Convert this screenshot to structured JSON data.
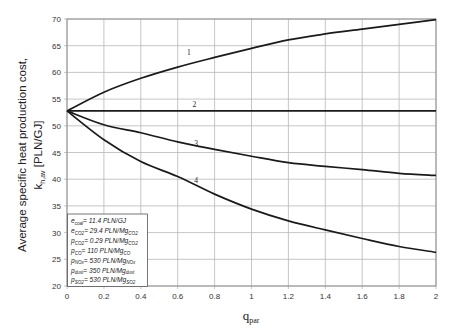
{
  "chart_data": {
    "type": "line",
    "title": "",
    "xlabel": "q_par",
    "xlabel_main": "q",
    "xlabel_sub": "par",
    "ylabel_line1": "Average specific heat production cost,",
    "ylabel_line2_main": "k",
    "ylabel_line2_sub": "h,av",
    "ylabel_line2_unit": " [PLN/GJ]",
    "xlim": [
      0,
      2
    ],
    "ylim": [
      20,
      70
    ],
    "grid": true,
    "x_ticks": [
      "0",
      "0.2",
      "0.4",
      "0.6",
      "0.8",
      "1",
      "1.2",
      "1.4",
      "1.6",
      "1.8",
      "2"
    ],
    "y_ticks": [
      "20",
      "25",
      "30",
      "35",
      "40",
      "45",
      "50",
      "55",
      "60",
      "65",
      "70"
    ],
    "x": [
      0,
      0.2,
      0.4,
      0.6,
      0.8,
      1.0,
      1.2,
      1.4,
      1.6,
      1.8,
      2.0
    ],
    "series": [
      {
        "name": "1",
        "values": [
          52.8,
          56.3,
          58.9,
          61.0,
          62.8,
          64.5,
          66.1,
          67.2,
          68.1,
          69.0,
          69.9
        ],
        "label_pos": [
          0.66,
          63.2
        ]
      },
      {
        "name": "2",
        "values": [
          52.8,
          52.8,
          52.8,
          52.8,
          52.8,
          52.8,
          52.8,
          52.8,
          52.8,
          52.8,
          52.8
        ],
        "label_pos": [
          0.69,
          53.6
        ]
      },
      {
        "name": "3",
        "values": [
          52.8,
          50.2,
          48.7,
          47.0,
          45.6,
          44.3,
          43.1,
          42.4,
          41.8,
          41.1,
          40.7
        ],
        "label_pos": [
          0.7,
          46.3
        ]
      },
      {
        "name": "4",
        "values": [
          52.8,
          47.4,
          43.3,
          40.5,
          37.2,
          34.4,
          32.2,
          30.5,
          28.9,
          27.4,
          26.3
        ],
        "label_pos": [
          0.7,
          39.2
        ]
      }
    ],
    "legend": {
      "position": "lower-left",
      "entries": [
        {
          "main": "e",
          "sub": "coal",
          "text": "= 11.4 PLN/GJ",
          "unit_sub": ""
        },
        {
          "main": "e",
          "sub": "CO2",
          "text": "= 29.4 PLN/Mg",
          "unit_sub": "CO2"
        },
        {
          "main": "p",
          "sub": "CO2",
          "text": "= 0.29 PLN/Mg",
          "unit_sub": "CO2"
        },
        {
          "main": "p",
          "sub": "CO",
          "text": "= 110 PLN/Mg",
          "unit_sub": "CO"
        },
        {
          "main": "p",
          "sub": "NOx",
          "text": "= 530 PLN/Mg",
          "unit_sub": "NOx"
        },
        {
          "main": "p",
          "sub": "dust",
          "text": "= 350 PLN/Mg",
          "unit_sub": "dust"
        },
        {
          "main": "p",
          "sub": "SO2",
          "text": "= 530 PLN/Mg",
          "unit_sub": "SO2"
        }
      ]
    }
  },
  "colors": {
    "line": "#1a1a1a",
    "grid": "#b8b8b8",
    "axis": "#888888",
    "background": "#ffffff"
  }
}
